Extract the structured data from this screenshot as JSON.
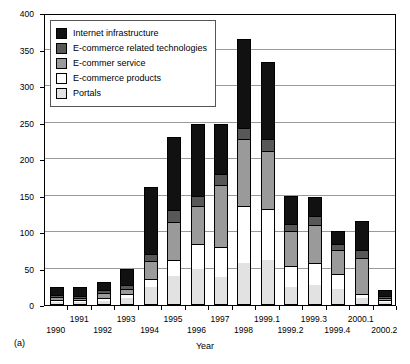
{
  "figure": {
    "sublabel": "(a)",
    "xtitle": "Year"
  },
  "legend": [
    {
      "label": "Internet infrastructure",
      "color": "#111111"
    },
    {
      "label": "E-commerce related technologies",
      "color": "#585858"
    },
    {
      "label": "E-commer service",
      "color": "#9a9a9a"
    },
    {
      "label": "E-commerce products",
      "color": "#ffffff"
    },
    {
      "label": "Portals",
      "color": "#e2e2e2"
    }
  ],
  "chart_data": {
    "type": "bar",
    "title": "",
    "xlabel": "Year",
    "ylabel": "",
    "ylim": [
      0,
      400
    ],
    "yticks": [
      0,
      50,
      100,
      150,
      200,
      250,
      300,
      350,
      400
    ],
    "grid": true,
    "stacked": true,
    "legend_position": "top-left",
    "categories": [
      "1990",
      "1991",
      "1992",
      "1993",
      "1994",
      "1995",
      "1996",
      "1997",
      "1998",
      "1999.1",
      "1999.2",
      "1999.3",
      "1999.4",
      "2000.1",
      "2000.2"
    ],
    "series": [
      {
        "name": "Portals",
        "color": "#e2e2e2",
        "values": [
          4,
          4,
          5,
          9,
          25,
          40,
          50,
          38,
          57,
          62,
          25,
          27,
          22,
          10,
          4
        ]
      },
      {
        "name": "E-commerce products",
        "color": "#ffffff",
        "values": [
          3,
          3,
          5,
          6,
          10,
          22,
          33,
          42,
          78,
          70,
          28,
          30,
          21,
          5,
          3
        ]
      },
      {
        "name": "E-commer service",
        "color": "#9a9a9a",
        "values": [
          4,
          3,
          6,
          7,
          25,
          52,
          52,
          85,
          92,
          79,
          48,
          53,
          32,
          50,
          3
        ]
      },
      {
        "name": "E-commerce related technologies",
        "color": "#585858",
        "values": [
          3,
          3,
          4,
          5,
          10,
          16,
          15,
          14,
          15,
          16,
          10,
          12,
          8,
          10,
          3
        ]
      },
      {
        "name": "Internet infrastructure",
        "color": "#111111",
        "values": [
          11,
          12,
          12,
          22,
          92,
          100,
          98,
          69,
          123,
          106,
          39,
          26,
          18,
          40,
          8
        ]
      }
    ],
    "totals": [
      25,
      25,
      32,
      49,
      162,
      230,
      248,
      248,
      365,
      333,
      150,
      148,
      101,
      115,
      21
    ]
  }
}
